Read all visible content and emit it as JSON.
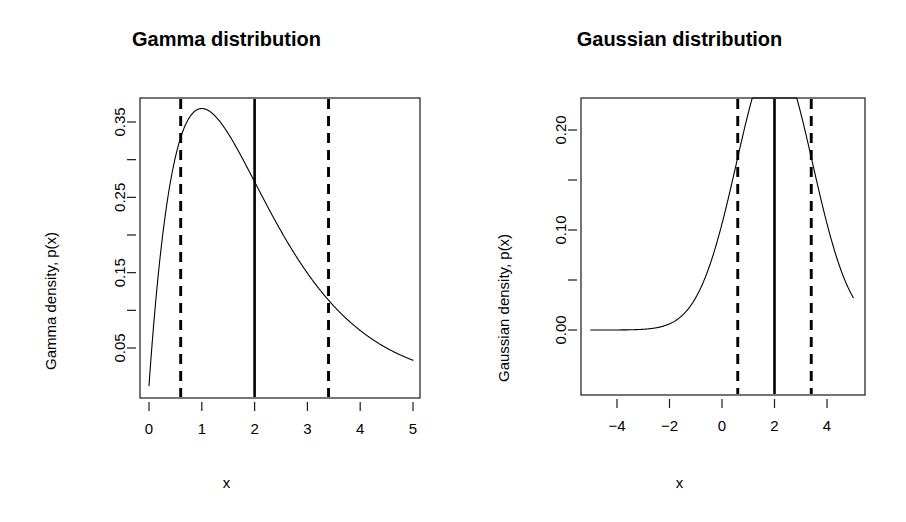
{
  "figure": {
    "background": "#ffffff",
    "foreground": "#000000",
    "width": 906,
    "height": 522,
    "panel_count": 2
  },
  "panels": [
    {
      "id": "gamma",
      "title": "Gamma distribution",
      "xlabel": "x",
      "ylabel": "Gamma density, p(x)"
    },
    {
      "id": "gaussian",
      "title": "Gaussian distribution",
      "xlabel": "x",
      "ylabel": "Gaussian density, p(x)"
    }
  ],
  "chart_data": [
    {
      "type": "line",
      "title": "Gamma distribution",
      "xlabel": "x",
      "ylabel": "Gamma density, p(x)",
      "xlim": [
        0,
        5
      ],
      "ylim": [
        0.0,
        0.378
      ],
      "grid": false,
      "legend": "none",
      "xticks": [
        0,
        1,
        2,
        3,
        4,
        5
      ],
      "xtick_labels": [
        "0",
        "1",
        "2",
        "3",
        "4",
        "5"
      ],
      "yticks": [
        0.05,
        0.15,
        0.25,
        0.35
      ],
      "ytick_labels": [
        "0.05",
        "0.15",
        "0.25",
        "0.35"
      ],
      "yticks_minor": [
        0.1,
        0.2,
        0.3
      ],
      "distribution": {
        "name": "gamma",
        "shape": 2,
        "rate": 1,
        "mean": 2,
        "mode": 1,
        "peak_density": 0.3679
      },
      "annotations": [
        {
          "name": "lower-quantile-line",
          "x": 0.6,
          "style": "dashed",
          "label": ""
        },
        {
          "name": "mean-line",
          "x": 2.0,
          "style": "solid",
          "label": ""
        },
        {
          "name": "upper-quantile-line",
          "x": 3.4,
          "style": "dashed",
          "label": ""
        }
      ],
      "x": [
        0.02,
        0.1,
        0.2,
        0.3,
        0.4,
        0.5,
        0.6,
        0.7,
        0.8,
        0.9,
        1.0,
        1.1,
        1.2,
        1.3,
        1.4,
        1.5,
        1.6,
        1.8,
        2.0,
        2.2,
        2.4,
        2.6,
        2.8,
        3.0,
        3.2,
        3.4,
        3.6,
        3.8,
        4.0,
        4.2,
        4.4,
        4.6,
        4.8,
        5.0
      ],
      "y": [
        0.0196,
        0.0905,
        0.1637,
        0.2222,
        0.2681,
        0.3033,
        0.3293,
        0.3476,
        0.3595,
        0.3659,
        0.3679,
        0.3662,
        0.3614,
        0.3543,
        0.3452,
        0.3347,
        0.323,
        0.2975,
        0.2707,
        0.2438,
        0.2177,
        0.1931,
        0.1703,
        0.1494,
        0.1304,
        0.1135,
        0.0984,
        0.085,
        0.0733,
        0.063,
        0.054,
        0.0462,
        0.0395,
        0.0337
      ]
    },
    {
      "type": "line",
      "title": "Gaussian distribution",
      "xlabel": "x",
      "ylabel": "Gaussian density, p(x)",
      "xlim": [
        -5,
        5
      ],
      "ylim": [
        0.0,
        0.286
      ],
      "grid": false,
      "legend": "none",
      "xticks": [
        -4,
        -2,
        0,
        2,
        4
      ],
      "xtick_labels": [
        "-4",
        "-2",
        "0",
        "2",
        "4"
      ],
      "yticks": [
        0.0,
        0.1,
        0.2
      ],
      "ytick_labels": [
        "0.00",
        "0.10",
        "0.20"
      ],
      "yticks_minor": [
        0.05,
        0.15,
        0.25
      ],
      "distribution": {
        "name": "normal",
        "mean": 2,
        "sd": 1.45,
        "peak_density": 0.2751
      },
      "annotations": [
        {
          "name": "lower-quantile-line",
          "x": 0.6,
          "style": "dashed",
          "label": ""
        },
        {
          "name": "mean-line",
          "x": 2.0,
          "style": "solid",
          "label": ""
        },
        {
          "name": "upper-quantile-line",
          "x": 3.4,
          "style": "dashed",
          "label": ""
        }
      ],
      "x": [
        -5.0,
        -4.5,
        -4.0,
        -3.5,
        -3.0,
        -2.5,
        -2.0,
        -1.5,
        -1.0,
        -0.5,
        0.0,
        0.5,
        1.0,
        1.5,
        2.0,
        2.5,
        3.0,
        3.5,
        4.0,
        4.5,
        5.0
      ],
      "y": [
        0.0,
        0.0001,
        0.0002,
        0.0005,
        0.0013,
        0.0029,
        0.006,
        0.0115,
        0.0204,
        0.0336,
        0.0512,
        0.0723,
        0.0944,
        0.1139,
        0.2751,
        0.2584,
        0.2127,
        0.1529,
        0.0944,
        0.0512,
        0.0238
      ]
    }
  ]
}
